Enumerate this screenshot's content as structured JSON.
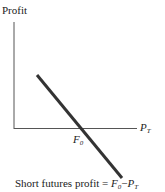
{
  "diagram": {
    "y_axis_label": "Profit",
    "x_axis_label": {
      "main": "P",
      "sub": "T"
    },
    "intercept_label": {
      "main": "F",
      "sub": "0"
    },
    "caption": {
      "prefix": "Short futures profit = ",
      "term1_main": "F",
      "term1_sub": "0",
      "minus": "−",
      "term2_main": "P",
      "term2_sub": "T"
    },
    "line_color": "#333333",
    "axis_color": "#555555"
  }
}
